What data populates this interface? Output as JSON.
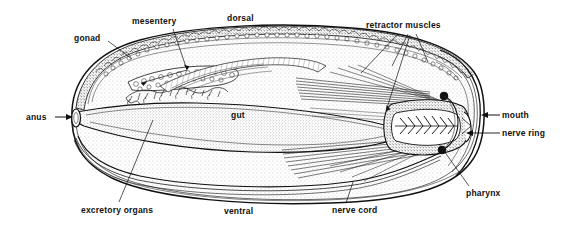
{
  "figure": {
    "organism": "sipunculan worm",
    "view": "longitudinal sagittal section",
    "style": "black-and-white stippled line engraving",
    "background_color": "#ffffff",
    "ink_color": "#111111",
    "stipple_color": "#6e6e6e"
  },
  "labels": {
    "gonad": "gonad",
    "mesentery": "mesentery",
    "dorsal": "dorsal",
    "retractor_muscles": "retractor muscles",
    "mouth": "mouth",
    "nerve_ring": "nerve ring",
    "pharynx": "pharynx",
    "nerve_cord": "nerve cord",
    "ventral": "ventral",
    "excretory_organs": "excretory organs",
    "gut": "gut",
    "anus": "anus"
  },
  "label_positions": {
    "gonad": {
      "x": 74,
      "y": 34
    },
    "mesentery": {
      "x": 132,
      "y": 17
    },
    "dorsal": {
      "x": 227,
      "y": 14
    },
    "retractor_muscles": {
      "x": 366,
      "y": 21
    },
    "mouth": {
      "x": 502,
      "y": 111
    },
    "nerve_ring": {
      "x": 502,
      "y": 129
    },
    "pharynx": {
      "x": 466,
      "y": 189
    },
    "nerve_cord": {
      "x": 332,
      "y": 206
    },
    "ventral": {
      "x": 224,
      "y": 207
    },
    "excretory_organs": {
      "x": 81,
      "y": 206
    },
    "gut": {
      "x": 231,
      "y": 111
    },
    "anus": {
      "x": 26,
      "y": 113
    }
  },
  "annotations": [
    {
      "name": "gonad",
      "type": "leader-line",
      "from": [
        108,
        41
      ],
      "to": [
        131,
        58
      ]
    },
    {
      "name": "mesentery",
      "type": "leader-line",
      "from": [
        172,
        28
      ],
      "to": [
        186,
        70
      ]
    },
    {
      "name": "mesentery-branch",
      "type": "leader-line",
      "from": [
        186,
        70
      ],
      "to": [
        140,
        82
      ]
    },
    {
      "name": "dorsal",
      "type": "static-text",
      "from": null,
      "to": null
    },
    {
      "name": "retractor-1",
      "type": "leader-line",
      "from": [
        397,
        33
      ],
      "to": [
        360,
        72
      ]
    },
    {
      "name": "retractor-2",
      "type": "leader-line",
      "from": [
        406,
        33
      ],
      "to": [
        390,
        66
      ]
    },
    {
      "name": "retractor-3",
      "type": "leader-line",
      "from": [
        414,
        33
      ],
      "to": [
        424,
        62
      ]
    },
    {
      "name": "retractor-4",
      "type": "leader-line",
      "from": [
        408,
        34
      ],
      "to": [
        385,
        110
      ]
    },
    {
      "name": "mouth",
      "type": "arrow-left",
      "from": [
        500,
        115
      ],
      "to": [
        481,
        115
      ]
    },
    {
      "name": "nerve-ring",
      "type": "arrow-left",
      "from": [
        500,
        133
      ],
      "to": [
        466,
        133
      ]
    },
    {
      "name": "pharynx",
      "type": "leader-line",
      "from": [
        468,
        186
      ],
      "to": [
        438,
        143
      ]
    },
    {
      "name": "nerve-cord",
      "type": "leader-line",
      "from": [
        345,
        203
      ],
      "to": [
        352,
        181
      ]
    },
    {
      "name": "ventral",
      "type": "static-text",
      "from": null,
      "to": null
    },
    {
      "name": "excretory-organs",
      "type": "leader-line",
      "from": [
        118,
        202
      ],
      "to": [
        152,
        120
      ]
    },
    {
      "name": "gut",
      "type": "static-text",
      "from": null,
      "to": null
    },
    {
      "name": "anus",
      "type": "arrow-right",
      "from": [
        55,
        117
      ],
      "to": [
        73,
        117
      ]
    }
  ]
}
